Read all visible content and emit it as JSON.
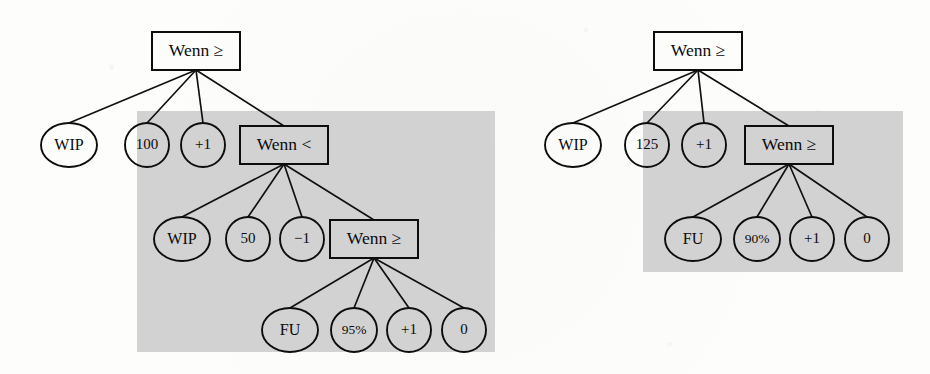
{
  "figure": {
    "kind": "expression-tree-diagram",
    "tree_count": 2,
    "ink_color": "#0d0d0d",
    "shade_color": "#d2d2d2",
    "page_color": "#fdfdfc"
  },
  "trees": [
    {
      "id": "left-tree",
      "shaded_region": {
        "x": 137,
        "y": 111,
        "width": 358,
        "height": 241
      },
      "nodes": [
        {
          "id": "l-root",
          "label": "Wenn ≥",
          "shape": "box",
          "cx": 196,
          "cy": 51,
          "w": 88,
          "h": 38,
          "size": "label-box"
        },
        {
          "id": "l-a1",
          "label": "WIP",
          "shape": "ellipse",
          "cx": 69,
          "cy": 145,
          "rx": 28,
          "ry": 22,
          "size": "label-big"
        },
        {
          "id": "l-a2",
          "label": "100",
          "shape": "ellipse",
          "cx": 147,
          "cy": 145,
          "rx": 22,
          "ry": 22,
          "size": "label-mid"
        },
        {
          "id": "l-a3",
          "label": "+1",
          "shape": "ellipse",
          "cx": 203,
          "cy": 145,
          "rx": 22,
          "ry": 22,
          "size": "label-mid"
        },
        {
          "id": "l-b0",
          "label": "Wenn <",
          "shape": "box",
          "cx": 284,
          "cy": 145,
          "w": 88,
          "h": 38,
          "size": "label-box"
        },
        {
          "id": "l-b1",
          "label": "WIP",
          "shape": "ellipse",
          "cx": 182,
          "cy": 239,
          "rx": 28,
          "ry": 22,
          "size": "label-big"
        },
        {
          "id": "l-b2",
          "label": "50",
          "shape": "ellipse",
          "cx": 248,
          "cy": 239,
          "rx": 22,
          "ry": 22,
          "size": "label-mid"
        },
        {
          "id": "l-b3",
          "label": "−1",
          "shape": "ellipse",
          "cx": 302,
          "cy": 239,
          "rx": 22,
          "ry": 22,
          "size": "label-mid"
        },
        {
          "id": "l-c0",
          "label": "Wenn ≥",
          "shape": "box",
          "cx": 374,
          "cy": 239,
          "w": 88,
          "h": 38,
          "size": "label-box"
        },
        {
          "id": "l-c1",
          "label": "FU",
          "shape": "ellipse",
          "cx": 290,
          "cy": 330,
          "rx": 28,
          "ry": 22,
          "size": "label-big"
        },
        {
          "id": "l-c2",
          "label": "95%",
          "shape": "ellipse",
          "cx": 354,
          "cy": 330,
          "rx": 23,
          "ry": 22,
          "size": "label-small"
        },
        {
          "id": "l-c3",
          "label": "+1",
          "shape": "ellipse",
          "cx": 409,
          "cy": 330,
          "rx": 22,
          "ry": 22,
          "size": "label-mid"
        },
        {
          "id": "l-c4",
          "label": "0",
          "shape": "ellipse",
          "cx": 464,
          "cy": 330,
          "rx": 22,
          "ry": 22,
          "size": "label-mid"
        }
      ],
      "edges": [
        {
          "from": "l-root",
          "to": "l-a1"
        },
        {
          "from": "l-root",
          "to": "l-a2"
        },
        {
          "from": "l-root",
          "to": "l-a3"
        },
        {
          "from": "l-root",
          "to": "l-b0"
        },
        {
          "from": "l-b0",
          "to": "l-b1"
        },
        {
          "from": "l-b0",
          "to": "l-b2"
        },
        {
          "from": "l-b0",
          "to": "l-b3"
        },
        {
          "from": "l-b0",
          "to": "l-c0"
        },
        {
          "from": "l-c0",
          "to": "l-c1"
        },
        {
          "from": "l-c0",
          "to": "l-c2"
        },
        {
          "from": "l-c0",
          "to": "l-c3"
        },
        {
          "from": "l-c0",
          "to": "l-c4"
        }
      ]
    },
    {
      "id": "right-tree",
      "shaded_region": {
        "x": 643,
        "y": 111,
        "width": 260,
        "height": 161
      },
      "nodes": [
        {
          "id": "r-root",
          "label": "Wenn ≥",
          "shape": "box",
          "cx": 698,
          "cy": 51,
          "w": 88,
          "h": 38,
          "size": "label-box"
        },
        {
          "id": "r-a1",
          "label": "WIP",
          "shape": "ellipse",
          "cx": 573,
          "cy": 145,
          "rx": 28,
          "ry": 22,
          "size": "label-big"
        },
        {
          "id": "r-a2",
          "label": "125",
          "shape": "ellipse",
          "cx": 647,
          "cy": 145,
          "rx": 22,
          "ry": 22,
          "size": "label-mid"
        },
        {
          "id": "r-a3",
          "label": "+1",
          "shape": "ellipse",
          "cx": 704,
          "cy": 145,
          "rx": 22,
          "ry": 22,
          "size": "label-mid"
        },
        {
          "id": "r-b0",
          "label": "Wenn ≥",
          "shape": "box",
          "cx": 789,
          "cy": 145,
          "w": 88,
          "h": 38,
          "size": "label-box"
        },
        {
          "id": "r-b1",
          "label": "FU",
          "shape": "ellipse",
          "cx": 693,
          "cy": 239,
          "rx": 28,
          "ry": 22,
          "size": "label-big"
        },
        {
          "id": "r-b2",
          "label": "90%",
          "shape": "ellipse",
          "cx": 757,
          "cy": 239,
          "rx": 23,
          "ry": 22,
          "size": "label-small"
        },
        {
          "id": "r-b3",
          "label": "+1",
          "shape": "ellipse",
          "cx": 812,
          "cy": 239,
          "rx": 22,
          "ry": 22,
          "size": "label-mid"
        },
        {
          "id": "r-b4",
          "label": "0",
          "shape": "ellipse",
          "cx": 867,
          "cy": 239,
          "rx": 22,
          "ry": 22,
          "size": "label-mid"
        }
      ],
      "edges": [
        {
          "from": "r-root",
          "to": "r-a1"
        },
        {
          "from": "r-root",
          "to": "r-a2"
        },
        {
          "from": "r-root",
          "to": "r-a3"
        },
        {
          "from": "r-root",
          "to": "r-b0"
        },
        {
          "from": "r-b0",
          "to": "r-b1"
        },
        {
          "from": "r-b0",
          "to": "r-b2"
        },
        {
          "from": "r-b0",
          "to": "r-b3"
        },
        {
          "from": "r-b0",
          "to": "r-b4"
        }
      ]
    }
  ]
}
